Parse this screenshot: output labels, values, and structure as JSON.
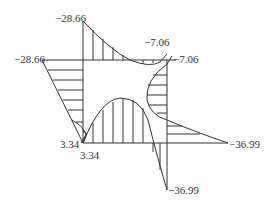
{
  "diagram": {
    "type": "bending moment diagram (frame)",
    "line_color": "#333333",
    "labels": {
      "top_left_column_top": "−28.66",
      "top_left_beam_left": "−28.66",
      "top_right_beam_end": "−7.06",
      "top_right_column_top": "−7.06",
      "bottom_left_column": "3.34",
      "bottom_left_beam": "3.34",
      "bottom_right_beam_end": "−36.99",
      "bottom_right_column_bottom": "−36.99"
    }
  }
}
